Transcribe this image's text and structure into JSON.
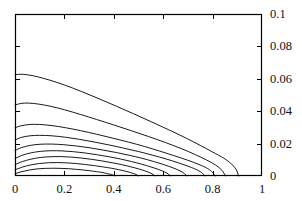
{
  "chart_data": {
    "type": "line",
    "title": "",
    "subtitle": "",
    "xlabel": "",
    "ylabel": "",
    "xlim": [
      0,
      1
    ],
    "ylim": [
      0,
      0.1
    ],
    "grid": false,
    "legend": null,
    "legend_position": "none",
    "x_ticks": [
      0,
      0.2,
      0.4,
      0.6,
      0.8,
      1
    ],
    "x_tick_labels": [
      "0",
      "0.2",
      "0.4",
      "0.6",
      "0.8",
      "1"
    ],
    "y_ticks": [
      0,
      0.02,
      0.04,
      0.06,
      0.08,
      0.1
    ],
    "y_tick_labels": [
      "0",
      "0.02",
      "0.04",
      "0.06",
      "0.08",
      "0.1"
    ],
    "y_axis_labels_side": "right",
    "x_axis_labels_side": "bottom",
    "frame": true,
    "tick_direction": "in",
    "line_color": "#000000",
    "background_color": "#ffffff",
    "series": [
      {
        "name": "contour-1",
        "x": [
          0.0,
          0.02,
          0.05,
          0.09,
          0.14,
          0.2,
          0.27,
          0.34,
          0.41,
          0.48,
          0.55,
          0.62,
          0.69,
          0.75,
          0.8,
          0.845,
          0.875,
          0.895,
          0.905
        ],
        "y": [
          0.0625,
          0.0628,
          0.0625,
          0.0613,
          0.0592,
          0.0562,
          0.0521,
          0.0477,
          0.0431,
          0.0384,
          0.0336,
          0.0287,
          0.0236,
          0.0189,
          0.0148,
          0.011,
          0.0076,
          0.0042,
          0.0
        ]
      },
      {
        "name": "contour-2",
        "x": [
          0.0,
          0.025,
          0.055,
          0.095,
          0.145,
          0.2,
          0.265,
          0.33,
          0.4,
          0.47,
          0.54,
          0.61,
          0.675,
          0.73,
          0.775,
          0.812,
          0.838,
          0.852
        ],
        "y": [
          0.0438,
          0.0448,
          0.045,
          0.0444,
          0.043,
          0.0409,
          0.038,
          0.0349,
          0.0315,
          0.028,
          0.0244,
          0.0206,
          0.0168,
          0.0132,
          0.0099,
          0.0068,
          0.0035,
          0.0
        ]
      },
      {
        "name": "contour-3",
        "x": [
          0.0,
          0.025,
          0.06,
          0.1,
          0.15,
          0.205,
          0.265,
          0.33,
          0.395,
          0.46,
          0.525,
          0.585,
          0.645,
          0.7,
          0.745,
          0.78,
          0.8,
          0.81
        ],
        "y": [
          0.0298,
          0.031,
          0.0318,
          0.0318,
          0.0311,
          0.0298,
          0.028,
          0.0258,
          0.0234,
          0.0209,
          0.0182,
          0.0154,
          0.0125,
          0.0097,
          0.0071,
          0.0046,
          0.0022,
          0.0
        ]
      },
      {
        "name": "contour-4",
        "x": [
          0.0,
          0.025,
          0.06,
          0.1,
          0.15,
          0.205,
          0.262,
          0.32,
          0.38,
          0.44,
          0.5,
          0.558,
          0.612,
          0.662,
          0.705,
          0.738,
          0.758,
          0.768
        ],
        "y": [
          0.0222,
          0.0238,
          0.0248,
          0.0251,
          0.0248,
          0.0239,
          0.0226,
          0.021,
          0.0192,
          0.0172,
          0.0151,
          0.0128,
          0.0105,
          0.0081,
          0.0058,
          0.0037,
          0.0018,
          0.0
        ]
      },
      {
        "name": "contour-5",
        "x": [
          0.0,
          0.028,
          0.062,
          0.102,
          0.148,
          0.198,
          0.25,
          0.303,
          0.357,
          0.41,
          0.462,
          0.513,
          0.56,
          0.603,
          0.64,
          0.668,
          0.686,
          0.695
        ],
        "y": [
          0.0158,
          0.0176,
          0.0189,
          0.0196,
          0.0197,
          0.0193,
          0.0185,
          0.0174,
          0.016,
          0.0145,
          0.0128,
          0.011,
          0.009,
          0.007,
          0.005,
          0.0032,
          0.0015,
          0.0
        ]
      },
      {
        "name": "contour-6",
        "x": [
          0.0,
          0.03,
          0.065,
          0.103,
          0.145,
          0.19,
          0.237,
          0.285,
          0.333,
          0.38,
          0.427,
          0.472,
          0.513,
          0.55,
          0.582,
          0.606,
          0.621,
          0.628
        ],
        "y": [
          0.0108,
          0.0128,
          0.0143,
          0.0152,
          0.0156,
          0.0155,
          0.015,
          0.0142,
          0.0131,
          0.0119,
          0.0105,
          0.0089,
          0.0073,
          0.0056,
          0.004,
          0.0025,
          0.0012,
          0.0
        ]
      },
      {
        "name": "contour-7",
        "x": [
          0.0,
          0.03,
          0.065,
          0.102,
          0.142,
          0.183,
          0.225,
          0.268,
          0.31,
          0.352,
          0.393,
          0.432,
          0.468,
          0.5,
          0.527,
          0.547,
          0.56,
          0.566
        ],
        "y": [
          0.007,
          0.0089,
          0.0104,
          0.0114,
          0.0119,
          0.012,
          0.0117,
          0.0111,
          0.0103,
          0.0093,
          0.0082,
          0.007,
          0.0057,
          0.0044,
          0.0031,
          0.0019,
          0.0009,
          0.0
        ]
      },
      {
        "name": "contour-8",
        "x": [
          0.0,
          0.03,
          0.063,
          0.098,
          0.135,
          0.172,
          0.21,
          0.248,
          0.285,
          0.322,
          0.357,
          0.39,
          0.42,
          0.446,
          0.468,
          0.484,
          0.494,
          0.499
        ],
        "y": [
          0.0038,
          0.0055,
          0.0068,
          0.0077,
          0.0082,
          0.0083,
          0.0081,
          0.0077,
          0.0071,
          0.0064,
          0.0056,
          0.0048,
          0.0039,
          0.003,
          0.0021,
          0.0013,
          0.0006,
          0.0
        ]
      },
      {
        "name": "contour-9",
        "x": [
          0.0,
          0.028,
          0.058,
          0.09,
          0.122,
          0.154,
          0.186,
          0.218,
          0.249,
          0.278,
          0.305,
          0.33,
          0.352,
          0.37,
          0.385,
          0.395,
          0.401,
          0.404
        ],
        "y": [
          0.0014,
          0.0027,
          0.0037,
          0.0044,
          0.0047,
          0.0048,
          0.0047,
          0.0045,
          0.0041,
          0.0037,
          0.0032,
          0.0027,
          0.0022,
          0.0016,
          0.0011,
          0.0007,
          0.0003,
          0.0
        ]
      }
    ]
  },
  "axes": {
    "frame_left_px": 15,
    "frame_top_px": 14,
    "frame_right_px": 262,
    "frame_bottom_px": 176
  }
}
